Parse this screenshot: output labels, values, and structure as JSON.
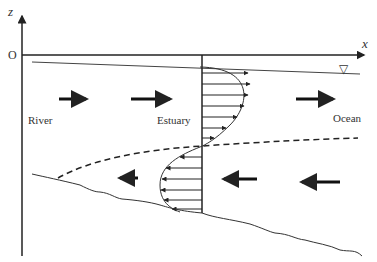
{
  "diagram": {
    "axes": {
      "x_label": "x",
      "z_label": "z",
      "origin_label": "O"
    },
    "regions": [
      {
        "label": "River"
      },
      {
        "label": "Estuary"
      },
      {
        "label": "Ocean"
      }
    ],
    "symbols": {
      "water_surface": "▽"
    },
    "flow": {
      "upper_layer_direction": "seaward (right)",
      "lower_layer_direction": "landward (left)"
    },
    "colors": {
      "line": "#222222",
      "background": "#ffffff"
    }
  }
}
